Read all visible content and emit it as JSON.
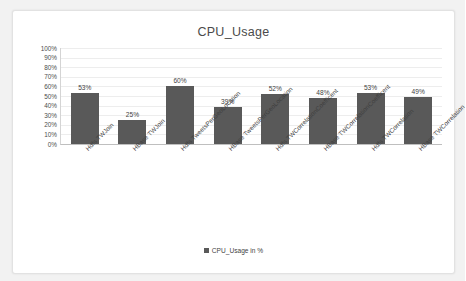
{
  "chart_data": {
    "type": "bar",
    "title": "CPU_Usage",
    "xlabel": "",
    "ylabel": "",
    "ylim": [
      0,
      100
    ],
    "ytick_labels": [
      "100%",
      "90%",
      "80%",
      "70%",
      "60%",
      "50%",
      "40%",
      "30%",
      "20%",
      "10%",
      "0%"
    ],
    "ytick_values": [
      100,
      90,
      80,
      70,
      60,
      50,
      40,
      30,
      20,
      10,
      0
    ],
    "grid": true,
    "legend_position": "bottom",
    "categories": [
      "Hdfs TWJoin",
      "HBase TWJoin",
      "Hdfs TweetsPerGeoLocation",
      "HBase TweetsPerGeoLocation",
      "Hdfs TWCorrelationCoefficent",
      "HBase TWCorrelationCoefficent",
      "Hdfs TWCorrelation",
      "HBase TWCorrelation"
    ],
    "series": [
      {
        "name": "CPU_Usage in %",
        "values": [
          53,
          25,
          60,
          39,
          52,
          48,
          53,
          49
        ],
        "data_labels": [
          "53%",
          "25%",
          "60%",
          "39%",
          "52%",
          "48%",
          "53%",
          "49%"
        ],
        "color": "#595959"
      }
    ]
  },
  "legend": {
    "entries": [
      {
        "label": "CPU_Usage in %",
        "color": "#595959"
      }
    ]
  },
  "colors": {
    "bar": "#595959",
    "gridline": "#ededed",
    "axis": "#bfbfbf",
    "text": "#3f3f3f",
    "card_background": "#ffffff",
    "page_background": "#f2f2f2"
  }
}
